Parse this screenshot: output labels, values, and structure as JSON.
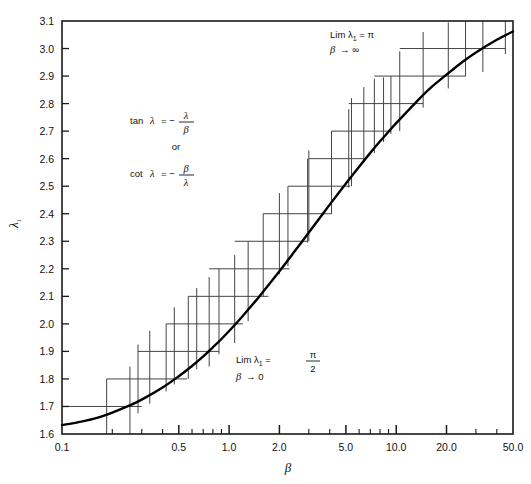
{
  "figure": {
    "background_color": "#ffffff",
    "frame_color": "#1a1a1a",
    "curve_color": "#000000",
    "marker_color": "#444444"
  },
  "axes": {
    "x": {
      "label": "β",
      "scale": "log",
      "min": 0.1,
      "max": 50.0,
      "tick_labels": [
        "0.1",
        "0.5",
        "1.0",
        "2.0",
        "5.0",
        "10.0",
        "20.0",
        "50.0"
      ],
      "tick_values": [
        0.1,
        0.5,
        1.0,
        2.0,
        5.0,
        10.0,
        20.0,
        50.0
      ],
      "minor_ticks": [
        0.2,
        0.3,
        0.4,
        0.6,
        0.7,
        0.8,
        0.9,
        3.0,
        4.0,
        6.0,
        7.0,
        8.0,
        9.0,
        30.0,
        40.0
      ]
    },
    "y": {
      "label": "λ",
      "label_subscript": "1",
      "scale": "linear",
      "min": 1.6,
      "max": 3.1,
      "tick_labels": [
        "1.6",
        "1.7",
        "1.8",
        "1.9",
        "2.0",
        "2.1",
        "2.2",
        "2.3",
        "2.4",
        "2.5",
        "2.6",
        "2.7",
        "2.8",
        "2.9",
        "3.0",
        "3.1"
      ],
      "tick_values": [
        1.6,
        1.7,
        1.8,
        1.9,
        2.0,
        2.1,
        2.2,
        2.3,
        2.4,
        2.5,
        2.6,
        2.7,
        2.8,
        2.9,
        3.0,
        3.1
      ]
    }
  },
  "annotations": {
    "equation": {
      "line1_prefix": "tan",
      "line1_var": "λ",
      "line1_eq": "= −",
      "line1_num": "λ",
      "line1_den": "β",
      "connector": "or",
      "line2_prefix": "cot",
      "line2_var": "λ",
      "line2_eq": "= −",
      "line2_num": "β",
      "line2_den": "λ"
    },
    "limit_upper": {
      "text": "Lim  λ",
      "subscript": "1",
      "equals": "= π",
      "condition_var": "β",
      "condition_arrow": "→ ∞"
    },
    "limit_lower": {
      "text": "Lim  λ",
      "subscript": "1",
      "equals": "=",
      "frac_num": "π",
      "frac_den": "2",
      "condition_var": "β",
      "condition_arrow": "→ 0"
    }
  },
  "chart_data": {
    "type": "line",
    "title": "",
    "xlabel": "β",
    "ylabel": "λ₁",
    "xlim": [
      0.1,
      50.0
    ],
    "ylim": [
      1.6,
      3.1
    ],
    "xscale": "log",
    "grid": false,
    "legend": null,
    "series": [
      {
        "name": "λ₁ root of tanλ = -λ/β",
        "x": [
          0.1,
          0.13,
          0.16,
          0.2,
          0.25,
          0.3,
          0.4,
          0.5,
          0.6,
          0.7,
          0.8,
          0.9,
          1.0,
          1.2,
          1.5,
          2.0,
          2.5,
          3.0,
          4.0,
          5.0,
          6.0,
          7.0,
          8.0,
          9.0,
          10.0,
          13.0,
          16.0,
          20.0,
          25.0,
          30.0,
          40.0,
          50.0
        ],
        "y": [
          1.632,
          1.645,
          1.658,
          1.678,
          1.702,
          1.725,
          1.769,
          1.81,
          1.847,
          1.882,
          1.915,
          1.945,
          1.974,
          2.027,
          2.096,
          2.191,
          2.268,
          2.332,
          2.433,
          2.51,
          2.571,
          2.621,
          2.663,
          2.698,
          2.729,
          2.802,
          2.856,
          2.905,
          2.952,
          2.986,
          3.032,
          3.062
        ]
      }
    ],
    "markers": {
      "description": "Staircase of crosshair markers: horizontal segment at each 0.1 level of lambda_1 with vertical tick bars straddling the curve",
      "levels": [
        1.7,
        1.8,
        1.9,
        2.0,
        2.1,
        2.2,
        2.3,
        2.4,
        2.5,
        2.6,
        2.7,
        2.8,
        2.9,
        3.0
      ],
      "level_spans": [
        {
          "y": 1.7,
          "x0": 0.1,
          "x1": 0.3
        },
        {
          "y": 1.8,
          "x0": 0.185,
          "x1": 0.56
        },
        {
          "y": 1.9,
          "x0": 0.285,
          "x1": 0.87
        },
        {
          "y": 2.0,
          "x0": 0.42,
          "x1": 1.21
        },
        {
          "y": 2.1,
          "x0": 0.57,
          "x1": 1.72
        },
        {
          "y": 2.2,
          "x0": 0.76,
          "x1": 2.3
        },
        {
          "y": 2.3,
          "x0": 1.08,
          "x1": 2.95
        },
        {
          "y": 2.4,
          "x0": 1.6,
          "x1": 4.1
        },
        {
          "y": 2.5,
          "x0": 2.25,
          "x1": 5.3
        },
        {
          "y": 2.6,
          "x0": 3.0,
          "x1": 6.4
        },
        {
          "y": 2.7,
          "x0": 4.1,
          "x1": 9.3
        },
        {
          "y": 2.8,
          "x0": 5.2,
          "x1": 14.5
        },
        {
          "y": 2.9,
          "x0": 7.4,
          "x1": 26.0
        },
        {
          "y": 3.0,
          "x0": 10.5,
          "x1": 45.0
        }
      ],
      "vertical_bars": [
        {
          "x": 0.185,
          "y0": 1.6,
          "y1": 1.8
        },
        {
          "x": 0.255,
          "y0": 1.6,
          "y1": 1.845
        },
        {
          "x": 0.285,
          "y0": 1.675,
          "y1": 1.925
        },
        {
          "x": 0.335,
          "y0": 1.71,
          "y1": 1.975
        },
        {
          "x": 0.42,
          "y0": 1.755,
          "y1": 2.0
        },
        {
          "x": 0.47,
          "y0": 1.78,
          "y1": 2.06
        },
        {
          "x": 0.57,
          "y0": 1.8,
          "y1": 2.1
        },
        {
          "x": 0.64,
          "y0": 1.835,
          "y1": 2.13
        },
        {
          "x": 0.76,
          "y0": 1.845,
          "y1": 2.17
        },
        {
          "x": 0.87,
          "y0": 1.89,
          "y1": 2.2
        },
        {
          "x": 1.08,
          "y0": 1.93,
          "y1": 2.25
        },
        {
          "x": 1.3,
          "y0": 2.01,
          "y1": 2.3
        },
        {
          "x": 1.6,
          "y0": 2.1,
          "y1": 2.4
        },
        {
          "x": 2.0,
          "y0": 2.18,
          "y1": 2.475
        },
        {
          "x": 2.25,
          "y0": 2.21,
          "y1": 2.5
        },
        {
          "x": 2.95,
          "y0": 2.295,
          "y1": 2.6
        },
        {
          "x": 3.0,
          "y0": 2.3,
          "y1": 2.63
        },
        {
          "x": 4.1,
          "y0": 2.4,
          "y1": 2.7
        },
        {
          "x": 5.2,
          "y0": 2.495,
          "y1": 2.78
        },
        {
          "x": 5.4,
          "y0": 2.5,
          "y1": 2.82
        },
        {
          "x": 6.4,
          "y0": 2.585,
          "y1": 2.86
        },
        {
          "x": 7.4,
          "y0": 2.62,
          "y1": 2.89
        },
        {
          "x": 8.4,
          "y0": 2.66,
          "y1": 2.895
        },
        {
          "x": 9.3,
          "y0": 2.69,
          "y1": 2.9
        },
        {
          "x": 10.5,
          "y0": 2.7,
          "y1": 2.99
        },
        {
          "x": 14.5,
          "y0": 2.785,
          "y1": 3.06
        },
        {
          "x": 20.5,
          "y0": 2.855,
          "y1": 3.095
        },
        {
          "x": 26.0,
          "y0": 2.9,
          "y1": 3.1
        },
        {
          "x": 33.0,
          "y0": 2.915,
          "y1": 3.1
        },
        {
          "x": 45.0,
          "y0": 2.98,
          "y1": 3.1
        }
      ]
    }
  }
}
